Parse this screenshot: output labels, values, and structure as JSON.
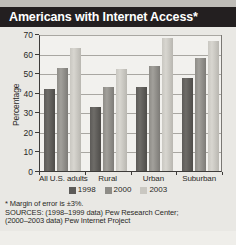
{
  "figure": {
    "title": "Americans with Internet Access*"
  },
  "chart_data": {
    "type": "bar",
    "title": "Americans with Internet Access*",
    "xlabel": "",
    "ylabel": "Percentage",
    "ylim": [
      0,
      70
    ],
    "yticks": [
      0,
      10,
      20,
      30,
      40,
      50,
      60,
      70
    ],
    "ytick_labels": [
      "0",
      "10",
      "20",
      "30",
      "40",
      "50",
      "60",
      "70"
    ],
    "grid": true,
    "legend_position": "bottom",
    "categories": [
      "All U.S. adults",
      "Rural",
      "Urban",
      "Suburban"
    ],
    "series": [
      {
        "name": "1998",
        "color": "#5d5b58",
        "values": [
          42,
          32.5,
          43,
          47.5
        ]
      },
      {
        "name": "2000",
        "color": "#8e8c87",
        "values": [
          52.5,
          43,
          53.5,
          58
        ]
      },
      {
        "name": "2003",
        "color": "#c9c7c1",
        "values": [
          63,
          52,
          68,
          66.5
        ]
      }
    ],
    "annotations": [
      "* Margin of error is ±3%.",
      "SOURCES: (1998–1999 data) Pew Research Center;",
      "(2000–2003 data) Pew Internet Project"
    ]
  },
  "notes": {
    "margin_of_error": "* Margin of error is ±3%.",
    "source_line_1": "SOURCES: (1998–1999 data) Pew Research Center;",
    "source_line_2": "(2000–2003 data) Pew Internet Project"
  },
  "colors": {
    "title_bar": "#231f20",
    "panel_background": "#f2f1ee",
    "figure_background": "#e9e8e4",
    "series_1998": "#5d5b58",
    "series_2000": "#8e8c87",
    "series_2003": "#c9c7c1"
  }
}
